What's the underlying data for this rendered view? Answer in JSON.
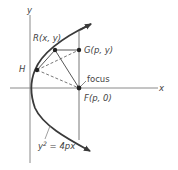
{
  "diagram": {
    "axes": {
      "x_label": "x",
      "y_label": "y"
    },
    "points": {
      "R": {
        "label": "R(x, y)"
      },
      "G": {
        "label": "G(p, y)"
      },
      "H": {
        "label": "H"
      },
      "F": {
        "label": "F(p, 0)",
        "note": "focus"
      }
    },
    "equation": {
      "lhs": "y",
      "exp": "2",
      "rhs": " = 4px"
    },
    "colors": {
      "curve": "#3a3a3a",
      "axis": "#777777",
      "text": "#444444"
    }
  }
}
